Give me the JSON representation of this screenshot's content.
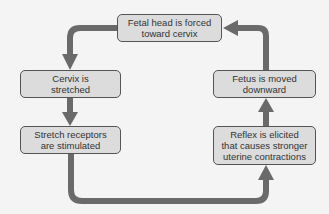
{
  "diagram": {
    "type": "positive-feedback-cycle",
    "colors": {
      "box_fill": "#dcdcdc",
      "box_border": "#555555",
      "arrow": "#6a6a6a",
      "background": "#f4f4f4"
    },
    "nodes": [
      {
        "id": "top",
        "lines": [
          "Fetal head is forced",
          "toward cervix"
        ]
      },
      {
        "id": "left1",
        "lines": [
          "Cervix is",
          "stretched"
        ]
      },
      {
        "id": "left2",
        "lines": [
          "Stretch receptors",
          "are stimulated"
        ]
      },
      {
        "id": "right2",
        "lines": [
          "Reflex is elicited",
          "that causes stronger",
          "uterine contractions"
        ]
      },
      {
        "id": "right1",
        "lines": [
          "Fetus is moved",
          "downward"
        ]
      }
    ],
    "edges": [
      [
        "top",
        "left1"
      ],
      [
        "left1",
        "left2"
      ],
      [
        "left2",
        "right2"
      ],
      [
        "right2",
        "right1"
      ],
      [
        "right1",
        "top"
      ]
    ]
  }
}
